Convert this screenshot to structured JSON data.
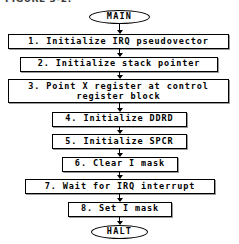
{
  "figure": {
    "title": "FIGURE 3-2."
  },
  "diagram": {
    "type": "flowchart",
    "orientation": "top-to-bottom",
    "colors": {
      "background": "#ffffff",
      "stroke": "#000000",
      "fill": "#ffffff",
      "shadow": "#9a9a9a"
    },
    "nodes": [
      {
        "id": "start",
        "shape": "terminator",
        "label": "MAIN"
      },
      {
        "id": "step1",
        "shape": "process",
        "label": "1. Initialize IRQ pseudovector"
      },
      {
        "id": "step2",
        "shape": "process",
        "label": "2. Initialize stack pointer"
      },
      {
        "id": "step3",
        "shape": "process",
        "label": "3. Point X register at control\nregister block"
      },
      {
        "id": "step4",
        "shape": "process",
        "label": "4. Initialize DDRD"
      },
      {
        "id": "step5",
        "shape": "process",
        "label": "5. Initialize SPCR"
      },
      {
        "id": "step6",
        "shape": "process",
        "label": "6. Clear I mask"
      },
      {
        "id": "step7",
        "shape": "process",
        "label": "7. Wait for IRQ interrupt"
      },
      {
        "id": "step8",
        "shape": "process",
        "label": "8. Set I mask"
      },
      {
        "id": "end",
        "shape": "terminator",
        "label": "HALT"
      }
    ],
    "edges": [
      {
        "from": "start",
        "to": "step1"
      },
      {
        "from": "step1",
        "to": "step2"
      },
      {
        "from": "step2",
        "to": "step3"
      },
      {
        "from": "step3",
        "to": "step4"
      },
      {
        "from": "step4",
        "to": "step5"
      },
      {
        "from": "step5",
        "to": "step6"
      },
      {
        "from": "step6",
        "to": "step7"
      },
      {
        "from": "step7",
        "to": "step8"
      },
      {
        "from": "step8",
        "to": "end"
      }
    ]
  }
}
